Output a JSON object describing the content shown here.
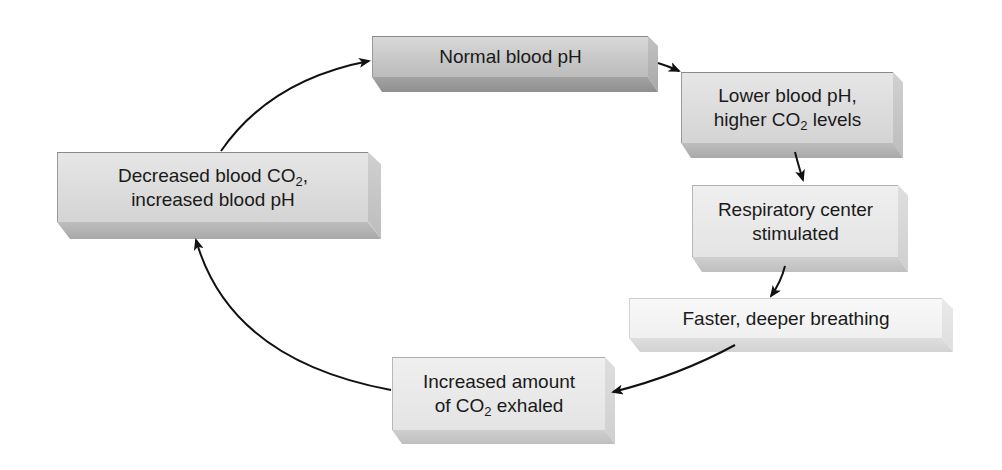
{
  "diagram": {
    "type": "cycle",
    "nodes": [
      {
        "id": "normal",
        "line1": "Normal blood pH",
        "line2_pre": "",
        "line2_sub": "",
        "line2_post": ""
      },
      {
        "id": "lower",
        "line1": "Lower blood pH,",
        "line2_pre": "higher CO",
        "line2_sub": "2",
        "line2_post": " levels"
      },
      {
        "id": "respiratory",
        "line1": "Respiratory center",
        "line2_pre": "stimulated",
        "line2_sub": "",
        "line2_post": ""
      },
      {
        "id": "faster",
        "line1": "Faster, deeper breathing",
        "line2_pre": "",
        "line2_sub": "",
        "line2_post": ""
      },
      {
        "id": "increased",
        "line1": "Increased amount",
        "line2_pre": "of CO",
        "line2_sub": "2",
        "line2_post": " exhaled"
      },
      {
        "id": "decreased",
        "line1_pre": "Decreased blood CO",
        "line1_sub": "2",
        "line1_post": ",",
        "line2_pre": "increased blood pH",
        "line2_sub": "",
        "line2_post": ""
      }
    ],
    "edges": [
      {
        "from": "normal",
        "to": "lower"
      },
      {
        "from": "lower",
        "to": "respiratory"
      },
      {
        "from": "respiratory",
        "to": "faster"
      },
      {
        "from": "faster",
        "to": "increased"
      },
      {
        "from": "increased",
        "to": "decreased"
      },
      {
        "from": "decreased",
        "to": "normal"
      }
    ],
    "colors": {
      "arrow": "#111111",
      "text": "#1a1a1a"
    }
  }
}
